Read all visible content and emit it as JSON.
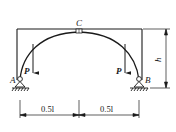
{
  "diagram": {
    "type": "three-hinged arch with frame",
    "labels": {
      "hinge_top": "C",
      "support_left": "A",
      "support_right": "B",
      "load_left": "P",
      "load_right": "P",
      "height": "h"
    },
    "dimensions": {
      "left_span": "0.5l",
      "right_span": "0.5l",
      "height": "h"
    },
    "colors": {
      "line": "#1a1a1a",
      "background": "#ffffff"
    }
  }
}
